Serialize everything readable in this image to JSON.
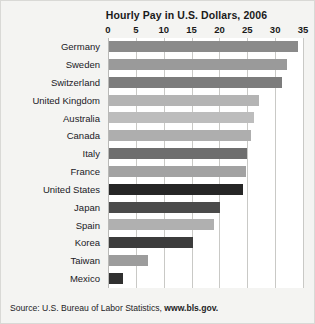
{
  "figure": {
    "title": "Hourly Pay in U.S. Dollars, 2006",
    "source_prefix": "Source: U.S. Bureau of Labor Statistics, ",
    "source_link": "www.bls.gov."
  },
  "chart_data": {
    "type": "bar",
    "orientation": "horizontal",
    "title": "Hourly Pay in U.S. Dollars, 2006",
    "xlabel": "",
    "ylabel": "",
    "xlim": [
      0,
      35
    ],
    "xticks": [
      0,
      5,
      10,
      15,
      20,
      25,
      30,
      35
    ],
    "grid": "vertical",
    "legend": "none",
    "categories": [
      "Germany",
      "Sweden",
      "Switzerland",
      "United Kingdom",
      "Australia",
      "Canada",
      "Italy",
      "France",
      "United States",
      "Japan",
      "Spain",
      "Korea",
      "Taiwan",
      "Mexico"
    ],
    "values": [
      34.0,
      32.0,
      31.0,
      27.0,
      26.0,
      25.5,
      24.8,
      24.6,
      24.0,
      20.0,
      18.8,
      15.0,
      7.0,
      2.6
    ],
    "bar_colors": [
      "#8a8a8a",
      "#9a9a9a",
      "#7c7c7c",
      "#b4b4b4",
      "#bdbdbd",
      "#aeaeae",
      "#6e6e6e",
      "#a2a2a2",
      "#262626",
      "#4a4a4a",
      "#b0b0b0",
      "#3c3c3c",
      "#9c9c9c",
      "#303030"
    ]
  }
}
